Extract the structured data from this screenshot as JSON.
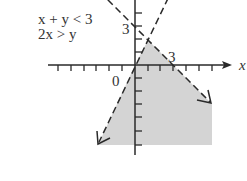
{
  "diagram": {
    "type": "system-of-inequalities-graph",
    "inequalities": [
      "x + y < 3",
      "2x > y"
    ],
    "axis_labels": {
      "x": "x",
      "origin": "0"
    },
    "tick_labels": {
      "y_intercept": "3",
      "x_intercept": "3"
    },
    "boundary_lines": [
      {
        "equation": "x + y = 3",
        "style": "dashed"
      },
      {
        "equation": "y = 2x",
        "style": "dashed"
      }
    ],
    "shaded_region": "below both lines, right of y = 2x and below x + y = 3",
    "intersection_point": [
      1,
      2
    ],
    "colors": {
      "shade": "#d4d4d4",
      "line": "#2a2a2a",
      "text": "#333333"
    }
  }
}
